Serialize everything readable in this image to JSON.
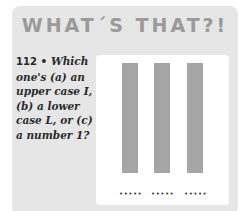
{
  "header": {
    "title": "WHAT´S THAT?!"
  },
  "question": {
    "number": "112",
    "separator": "•",
    "text": "Which one's (a) an upper case I, (b) a lower case L, or (c) a number 1?"
  },
  "figure": {
    "bars": [
      {
        "label": "bar-1"
      },
      {
        "label": "bar-2"
      },
      {
        "label": "bar-3"
      }
    ],
    "blanks": [
      "•••••",
      "•••••",
      "•••••"
    ],
    "colors": {
      "bar": "#a5a5a5",
      "card": "#e6e6e6",
      "panel": "#ffffff",
      "title": "#9a9a9a"
    }
  }
}
